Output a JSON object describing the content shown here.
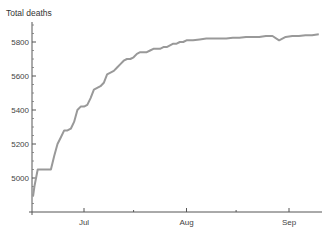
{
  "chart_data": {
    "type": "line",
    "title": "",
    "xlabel": "",
    "ylabel": "Total deaths",
    "ylim": [
      4800,
      5900
    ],
    "yticks": [
      5000,
      5200,
      5400,
      5600,
      5800
    ],
    "xtick_labels": [
      "Jul",
      "Aug",
      "Sep"
    ],
    "grid": false,
    "legend": null,
    "line_color": "#999999",
    "series": [
      {
        "name": "Total deaths",
        "x": [
          "Jun 15",
          "Jun 16",
          "Jun 17",
          "Jun 18",
          "Jun 19",
          "Jun 20",
          "Jun 21",
          "Jun 22",
          "Jun 23",
          "Jun 24",
          "Jun 25",
          "Jun 26",
          "Jun 27",
          "Jun 28",
          "Jun 29",
          "Jun 30",
          "Jul 1",
          "Jul 2",
          "Jul 3",
          "Jul 4",
          "Jul 5",
          "Jul 6",
          "Jul 7",
          "Jul 8",
          "Jul 9",
          "Jul 10",
          "Jul 11",
          "Jul 12",
          "Jul 13",
          "Jul 14",
          "Jul 15",
          "Jul 16",
          "Jul 17",
          "Jul 18",
          "Jul 19",
          "Jul 20",
          "Jul 21",
          "Jul 22",
          "Jul 23",
          "Jul 24",
          "Jul 25",
          "Jul 26",
          "Jul 27",
          "Jul 28",
          "Jul 29",
          "Jul 30",
          "Jul 31",
          "Aug 1",
          "Aug 3",
          "Aug 5",
          "Aug 7",
          "Aug 9",
          "Aug 11",
          "Aug 13",
          "Aug 15",
          "Aug 17",
          "Aug 19",
          "Aug 21",
          "Aug 23",
          "Aug 25",
          "Aug 27",
          "Aug 29",
          "Aug 31",
          "Sep 2",
          "Sep 4",
          "Sep 6",
          "Sep 8",
          "Sep 10"
        ],
        "values": [
          4890,
          4950,
          5050,
          5050,
          5050,
          5050,
          5050,
          5130,
          5200,
          5240,
          5280,
          5280,
          5290,
          5330,
          5400,
          5420,
          5420,
          5430,
          5470,
          5520,
          5530,
          5540,
          5560,
          5610,
          5620,
          5630,
          5650,
          5670,
          5690,
          5700,
          5700,
          5710,
          5730,
          5740,
          5740,
          5740,
          5750,
          5760,
          5760,
          5760,
          5770,
          5770,
          5780,
          5790,
          5790,
          5800,
          5800,
          5810,
          5810,
          5815,
          5820,
          5820,
          5820,
          5820,
          5825,
          5825,
          5830,
          5830,
          5830,
          5835,
          5835,
          5810,
          5830,
          5835,
          5835,
          5840,
          5840,
          5845
        ]
      }
    ]
  },
  "axis": {
    "y_title": "Total deaths",
    "y_tick_labels": [
      "5000",
      "5200",
      "5400",
      "5600",
      "5800"
    ],
    "x_tick_labels": [
      "Jul",
      "Aug",
      "Sep"
    ]
  }
}
